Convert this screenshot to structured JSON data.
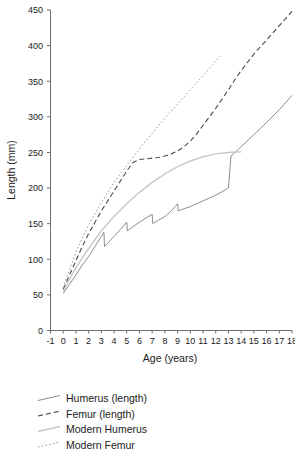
{
  "chart_data": {
    "type": "line",
    "title": "",
    "xlabel": "Age (years)",
    "ylabel": "Length (mm)",
    "xlim": [
      -1,
      18
    ],
    "ylim": [
      0,
      450
    ],
    "xticks": [
      -1,
      0,
      1,
      2,
      3,
      4,
      5,
      6,
      7,
      8,
      9,
      10,
      11,
      12,
      13,
      14,
      15,
      16,
      17,
      18
    ],
    "yticks": [
      0,
      50,
      100,
      150,
      200,
      250,
      300,
      350,
      400,
      450
    ],
    "xtick_labels": [
      "-1",
      "0",
      "1",
      "2",
      "3",
      "4",
      "5",
      "6",
      "7",
      "8",
      "9",
      "10",
      "11",
      "12",
      "13",
      "14",
      "15",
      "16",
      "17",
      "18"
    ],
    "ytick_labels": [
      "0",
      "50",
      "100",
      "150",
      "200",
      "250",
      "300",
      "350",
      "400",
      "450"
    ],
    "grid": false,
    "legend_position": "below-left",
    "series": [
      {
        "name": "Humerus (length)",
        "style": "solid",
        "color": "#808080",
        "x": [
          0,
          0.5,
          1,
          1.5,
          2,
          2.5,
          3,
          3.2,
          3.25,
          4,
          4.5,
          5,
          5.05,
          5.5,
          6,
          6.5,
          7,
          7.05,
          7.5,
          8,
          8.5,
          9,
          9.05,
          10,
          11,
          12,
          13,
          13.2,
          14,
          15,
          16,
          17,
          18
        ],
        "y": [
          52,
          65,
          78,
          92,
          104,
          118,
          132,
          138,
          118,
          132,
          142,
          152,
          140,
          146,
          152,
          158,
          163,
          150,
          155,
          160,
          168,
          178,
          168,
          174,
          182,
          190,
          200,
          245,
          258,
          275,
          292,
          310,
          330
        ]
      },
      {
        "name": "Femur (length)",
        "style": "dashed",
        "color": "#4a4a4a",
        "x": [
          0,
          0.5,
          1,
          1.5,
          2,
          2.5,
          3,
          3.5,
          4,
          4.5,
          5,
          5.5,
          6,
          6.5,
          7,
          7.5,
          8,
          8.5,
          9,
          9.5,
          10,
          10.5,
          11,
          11.5,
          12,
          12.5,
          13,
          13.5,
          14,
          15,
          16,
          17,
          18
        ],
        "y": [
          58,
          78,
          98,
          118,
          136,
          152,
          168,
          182,
          196,
          210,
          224,
          236,
          240,
          241,
          242,
          243,
          245,
          248,
          252,
          258,
          266,
          276,
          288,
          300,
          312,
          325,
          338,
          352,
          365,
          388,
          408,
          428,
          448
        ]
      },
      {
        "name": "Modern Humerus",
        "style": "solid-light",
        "color": "#c8c8c8",
        "x": [
          0,
          0.5,
          1,
          1.5,
          2,
          3,
          4,
          5,
          6,
          7,
          8,
          9,
          10,
          11,
          12,
          13,
          14
        ],
        "y": [
          55,
          72,
          88,
          102,
          115,
          140,
          160,
          178,
          194,
          208,
          220,
          230,
          238,
          244,
          248,
          250,
          251
        ]
      },
      {
        "name": "Modern Femur",
        "style": "dotted",
        "color": "#9a9a9a",
        "x": [
          0,
          0.5,
          1,
          1.5,
          2,
          2.5,
          3,
          3.5,
          4,
          4.5,
          5,
          6,
          7,
          8,
          9,
          10,
          11,
          12,
          12.3
        ],
        "y": [
          60,
          86,
          110,
          130,
          148,
          164,
          180,
          194,
          208,
          220,
          232,
          255,
          277,
          298,
          318,
          338,
          358,
          378,
          385
        ]
      }
    ]
  },
  "legend": {
    "items": [
      {
        "label": "Humerus (length)",
        "style": "solid",
        "color": "#808080"
      },
      {
        "label": "Femur (length)",
        "style": "dashed",
        "color": "#4a4a4a"
      },
      {
        "label": "Modern Humerus",
        "style": "solid-light",
        "color": "#c8c8c8"
      },
      {
        "label": "Modern Femur",
        "style": "dotted",
        "color": "#9a9a9a"
      }
    ]
  }
}
